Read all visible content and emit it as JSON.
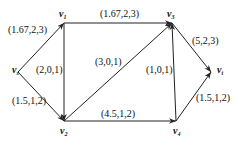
{
  "diagram": {
    "type": "directed-network-flow-graph",
    "nodes": [
      {
        "id": "vs",
        "base": "v",
        "sub": "s",
        "x": 18,
        "y": 72,
        "lx": 12,
        "ly": 73
      },
      {
        "id": "v1",
        "base": "v",
        "sub": "1",
        "x": 64,
        "y": 23,
        "lx": 59,
        "ly": 17
      },
      {
        "id": "v2",
        "base": "v",
        "sub": "2",
        "x": 64,
        "y": 121,
        "lx": 60,
        "ly": 134
      },
      {
        "id": "v3",
        "base": "v",
        "sub": "3",
        "x": 172,
        "y": 23,
        "lx": 167,
        "ly": 17
      },
      {
        "id": "v4",
        "base": "v",
        "sub": "4",
        "x": 176,
        "y": 121,
        "lx": 173,
        "ly": 134
      },
      {
        "id": "vt",
        "base": "v",
        "sub": "t",
        "x": 211,
        "y": 72,
        "lx": 217,
        "ly": 73
      }
    ],
    "edges": [
      {
        "from": "vs",
        "to": "v1",
        "label": "(1.67,2,3)",
        "lx": 8,
        "ly": 33
      },
      {
        "from": "vs",
        "to": "v2",
        "label": "(1.5,1,2)",
        "lx": 12,
        "ly": 104
      },
      {
        "from": "v1",
        "to": "v2",
        "label": "(2,0,1)",
        "lx": 36,
        "ly": 73
      },
      {
        "from": "v1",
        "to": "v3",
        "label": "(1.67,2,3)",
        "lx": 100,
        "ly": 17
      },
      {
        "from": "v2",
        "to": "v3",
        "label": "(3,0,1)",
        "lx": 95,
        "ly": 65
      },
      {
        "from": "v2",
        "to": "v4",
        "label": "(4.5,1,2)",
        "lx": 101,
        "ly": 117
      },
      {
        "from": "v4",
        "to": "v3",
        "label": "(1,0,1)",
        "lx": 146,
        "ly": 73
      },
      {
        "from": "v3",
        "to": "vt",
        "label": "(5,2,3)",
        "lx": 192,
        "ly": 44
      },
      {
        "from": "v4",
        "to": "vt",
        "label": "(1.5,1,2)",
        "lx": 196,
        "ly": 101
      }
    ]
  }
}
